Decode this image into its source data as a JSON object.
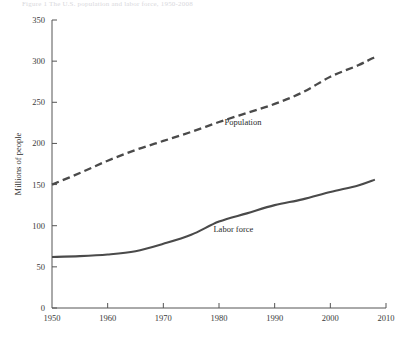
{
  "header": {
    "faint_caption": "  Figure 1   The U.S. population and labor force, 1950-2008"
  },
  "chart_data": {
    "type": "line",
    "title": "",
    "xlabel": "",
    "ylabel": "Millions of people",
    "xlim": [
      1950,
      2010
    ],
    "ylim": [
      0,
      350
    ],
    "grid": false,
    "legend": "inline-annotations",
    "xticks": [
      "1950",
      "1960",
      "1970",
      "1980",
      "1990",
      "2000",
      "2010"
    ],
    "xtick_values": [
      1950,
      1960,
      1970,
      1980,
      1990,
      2000,
      2010
    ],
    "yticks": [
      "0",
      "50",
      "100",
      "150",
      "200",
      "250",
      "300",
      "350"
    ],
    "ytick_values": [
      0,
      50,
      100,
      150,
      200,
      250,
      300,
      350
    ],
    "x": [
      1950,
      1955,
      1960,
      1965,
      1970,
      1975,
      1980,
      1985,
      1990,
      1995,
      2000,
      2005,
      2008
    ],
    "series": [
      {
        "name": "Population",
        "style": "dashed",
        "color": "#4a4a4a",
        "label_x": 1981,
        "label_y": 222,
        "values": [
          150,
          164,
          179,
          192,
          203,
          214,
          226,
          237,
          248,
          262,
          281,
          295,
          305
        ]
      },
      {
        "name": "Labor force",
        "style": "solid",
        "color": "#4a4a4a",
        "label_x": 1979,
        "label_y": 92,
        "values": [
          62,
          63,
          65,
          69,
          78,
          89,
          105,
          115,
          125,
          132,
          141,
          149,
          156
        ]
      }
    ]
  }
}
